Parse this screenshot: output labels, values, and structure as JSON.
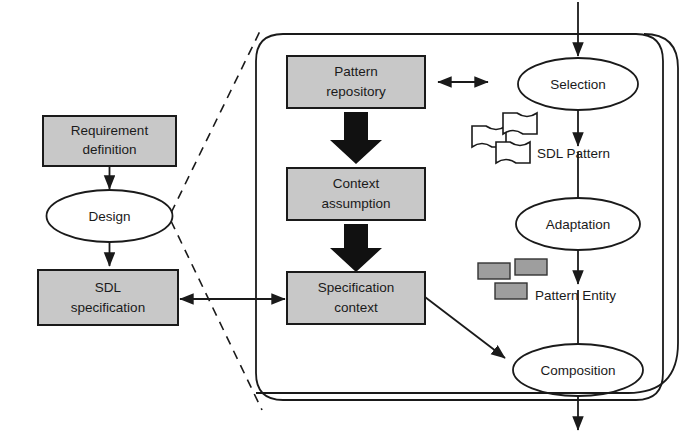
{
  "diagram": {
    "colors": {
      "box_fill": "#c8c8c8",
      "box_stroke": "#1a1a1a",
      "ellipse_fill": "#ffffff",
      "fat_arrow": "#111111",
      "entity_fill": "#9e9e9e",
      "background": "#ffffff"
    },
    "left_flow": {
      "nodes": [
        {
          "id": "requirement-definition",
          "shape": "rectangle",
          "line1": "Requirement",
          "line2": "definition"
        },
        {
          "id": "design",
          "shape": "ellipse",
          "line1": "Design",
          "line2": ""
        },
        {
          "id": "sdl-specification",
          "shape": "rectangle",
          "line1": "SDL",
          "line2": "specification"
        }
      ]
    },
    "center_flow": {
      "nodes": [
        {
          "id": "pattern-repository",
          "shape": "rectangle",
          "line1": "Pattern",
          "line2": "repository"
        },
        {
          "id": "context-assumption",
          "shape": "rectangle",
          "line1": "Context",
          "line2": "assumption"
        },
        {
          "id": "specification-context",
          "shape": "rectangle",
          "line1": "Specification",
          "line2": "context"
        }
      ]
    },
    "right_flow": {
      "nodes": [
        {
          "id": "selection",
          "shape": "ellipse",
          "line1": "Selection"
        },
        {
          "id": "adaptation",
          "shape": "ellipse",
          "line1": "Adaptation"
        },
        {
          "id": "composition",
          "shape": "ellipse",
          "line1": "Composition"
        }
      ]
    },
    "legends": [
      {
        "id": "sdl-pattern-legend",
        "label": "SDL Pattern",
        "glyph": "flags"
      },
      {
        "id": "pattern-entity-legend",
        "label": "Pattern Entity",
        "glyph": "gray-rectangles"
      }
    ],
    "connectors": [
      {
        "id": "requirement-to-design",
        "kind": "thin-arrow",
        "direction": "down"
      },
      {
        "id": "design-to-sdl-specification",
        "kind": "thin-arrow",
        "direction": "down"
      },
      {
        "id": "sdl-specification-to-specification-context",
        "kind": "thin-arrow",
        "direction": "bidirectional"
      },
      {
        "id": "pattern-repository-to-context-assumption",
        "kind": "fat-arrow",
        "direction": "down"
      },
      {
        "id": "context-assumption-to-specification-context",
        "kind": "fat-arrow",
        "direction": "down"
      },
      {
        "id": "pattern-repository-to-selection",
        "kind": "thin-arrow",
        "direction": "bidirectional"
      },
      {
        "id": "specification-context-to-composition",
        "kind": "thin-arrow",
        "direction": "diagonal-down-right"
      },
      {
        "id": "entry-to-selection",
        "kind": "thin-arrow",
        "direction": "down"
      },
      {
        "id": "selection-to-adaptation",
        "kind": "thin-arrow",
        "direction": "down"
      },
      {
        "id": "adaptation-to-composition",
        "kind": "thin-arrow",
        "direction": "down"
      },
      {
        "id": "composition-exit",
        "kind": "thin-arrow",
        "direction": "down"
      },
      {
        "id": "composition-feedback-loop",
        "kind": "thin-line",
        "direction": "loop-right"
      },
      {
        "id": "zoom-guide-upper",
        "kind": "dashed",
        "direction": "diagonal"
      },
      {
        "id": "zoom-guide-lower",
        "kind": "dashed",
        "direction": "diagonal"
      }
    ]
  }
}
